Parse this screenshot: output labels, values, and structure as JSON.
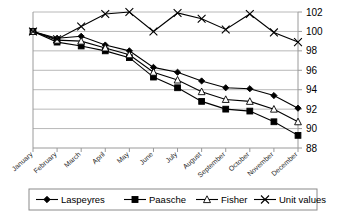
{
  "chart_data": {
    "type": "line",
    "title": "",
    "xlabel": "",
    "ylabel": "",
    "grid": true,
    "legend_position": "bottom",
    "ylim": [
      88,
      102
    ],
    "yticks": [
      88,
      90,
      92,
      94,
      96,
      98,
      100,
      102
    ],
    "categories": [
      "January",
      "February",
      "March",
      "April",
      "May",
      "June",
      "July",
      "August",
      "September",
      "October",
      "November",
      "December"
    ],
    "series": [
      {
        "name": "Laspeyres",
        "marker": "filled-diamond",
        "values": [
          100.0,
          99.3,
          99.5,
          98.6,
          98.0,
          96.3,
          95.8,
          94.9,
          94.2,
          94.1,
          93.4,
          92.1
        ]
      },
      {
        "name": "Paasche",
        "marker": "filled-square",
        "values": [
          100.0,
          98.9,
          98.5,
          98.0,
          97.3,
          95.3,
          94.2,
          92.8,
          92.0,
          91.8,
          90.7,
          89.3
        ]
      },
      {
        "name": "Fisher",
        "marker": "open-triangle",
        "values": [
          100.0,
          99.1,
          99.0,
          98.3,
          97.6,
          95.8,
          95.0,
          93.8,
          93.0,
          92.8,
          92.0,
          90.7
        ]
      },
      {
        "name": "Unit values",
        "marker": "x-cross",
        "values": [
          100.0,
          99.2,
          100.5,
          101.8,
          102.0,
          100.0,
          101.9,
          101.3,
          100.2,
          101.8,
          99.9,
          98.9
        ]
      }
    ]
  },
  "legend": {
    "items": [
      {
        "label": "Laspeyres"
      },
      {
        "label": "Paasche"
      },
      {
        "label": "Fisher"
      },
      {
        "label": "Unit values"
      }
    ]
  },
  "axis": {
    "y_tick_labels": [
      "102",
      "100",
      "98",
      "96",
      "94",
      "92",
      "90",
      "88"
    ],
    "x_tick_labels": [
      "January",
      "February",
      "March",
      "April",
      "May",
      "June",
      "July",
      "August",
      "September",
      "October",
      "November",
      "December"
    ]
  },
  "colors": {
    "series_stroke": "#000000",
    "gridline": "#b8b8b8",
    "axis": "#9a9a9a",
    "background": "#ffffff"
  }
}
